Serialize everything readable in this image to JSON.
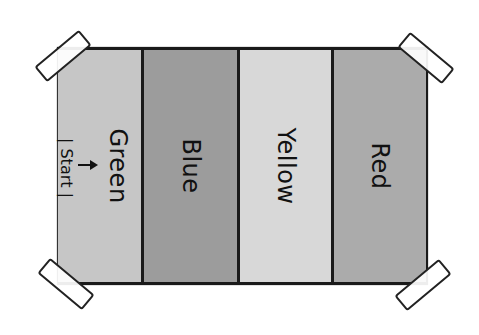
{
  "stripes": [
    {
      "label": "Green",
      "color": "#c6c6c6",
      "width": 83
    },
    {
      "label": "Blue",
      "color": "#9c9c9c",
      "width": 96
    },
    {
      "label": "Yellow",
      "color": "#d8d8d8",
      "width": 94
    },
    {
      "label": "Red",
      "color": "#ababab",
      "width": 98
    }
  ],
  "start_label": "| Start |",
  "arrow": "→",
  "tapes": [
    {
      "corner": "top-left",
      "x": 35,
      "y": 44,
      "angle": -40
    },
    {
      "corner": "top-right",
      "x": 395,
      "y": 44,
      "angle": 40
    },
    {
      "corner": "bottom-left",
      "x": 35,
      "y": 278,
      "angle": 40
    },
    {
      "corner": "bottom-right",
      "x": 392,
      "y": 278,
      "angle": -40
    }
  ]
}
